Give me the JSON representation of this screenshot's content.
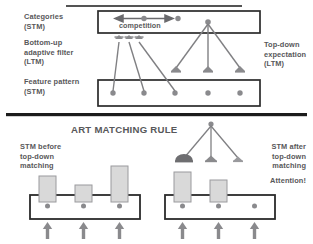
{
  "figure": {
    "title": "ART MATCHING RULE",
    "top_panel": {
      "labels_left": [
        {
          "id": "categories",
          "lines": [
            "Categories",
            "(STM)"
          ]
        },
        {
          "id": "bottom-up-adaptive-filter",
          "lines": [
            "Bottom-up",
            "adaptive filter",
            "(LTM)"
          ]
        },
        {
          "id": "feature-pattern",
          "lines": [
            "Feature pattern",
            "(STM)"
          ]
        }
      ],
      "labels_right": [
        {
          "id": "top-down-expectation",
          "lines": [
            "Top-down",
            "expectation",
            "(LTM)"
          ]
        }
      ],
      "competition_label": "competition",
      "categories_nodes": 2,
      "feature_nodes": 5,
      "bottom_up_links": 3,
      "top_down_links": 3
    },
    "bottom_panel": {
      "labels_left": [
        {
          "id": "stm-before",
          "lines": [
            "STM before",
            "top-down",
            "matching"
          ]
        }
      ],
      "labels_right": [
        {
          "id": "stm-after",
          "lines": [
            "STM after",
            "top-down",
            "matching"
          ]
        },
        {
          "id": "attention",
          "lines": [
            "Attention!"
          ]
        }
      ],
      "left_diagram": {
        "bars": [
          3,
          2,
          4
        ],
        "nodes": 3,
        "input_arrows": 3
      },
      "right_diagram": {
        "bars": [
          4,
          3,
          0
        ],
        "nodes": 3,
        "input_arrows": 3,
        "top_down_links": 3
      }
    },
    "colors": {
      "ink": "#58585a",
      "line": "#808083",
      "box_border": "#2b2b2b",
      "node_fill": "#8a8a8d",
      "bar_fill": "#d9d9d9",
      "bar_border": "#9a9a9d",
      "arrowhead": "#8a8a8d",
      "attention_head": "#6e6e71",
      "rule_line": "#1c1c1c",
      "background": "#ffffff"
    }
  }
}
